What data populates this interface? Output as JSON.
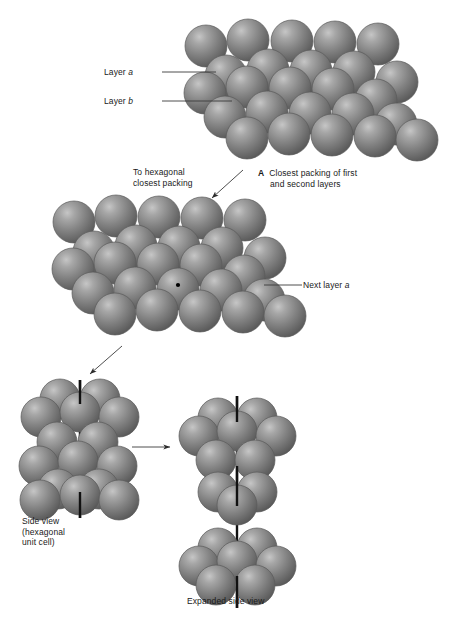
{
  "figure": {
    "title_panel_a": "A  Closest packing of first and second layers",
    "background_color": "#ffffff",
    "sphere_color": "#7d7d7d",
    "sphere_highlight_color": "#b9b9b9",
    "sphere_shadow_color": "#4a4a4a",
    "sphere_outline_color": "#5a5a5a",
    "line_color": "#3a3a3a",
    "axis_color": "#111111"
  },
  "labels": {
    "layer_a": {
      "text_prefix": "Layer ",
      "text_italic": "a"
    },
    "layer_b": {
      "text_prefix": "Layer ",
      "text_italic": "b"
    },
    "next_layer_a": {
      "text_prefix": "Next layer ",
      "text_italic": "a"
    },
    "to_hexagonal": {
      "line1": "To hexagonal",
      "line2": "closest packing"
    },
    "caption_a": {
      "marker": "A",
      "line1": "Closest packing of first",
      "line2": "and second layers"
    },
    "side_view": {
      "line1": "Side view",
      "line2": "(hexagonal",
      "line3": "unit cell)"
    },
    "expanded_side_view": {
      "text": "Expanded side view"
    }
  },
  "clusters": {
    "top": {
      "name": "closest-packing-first-second-layers",
      "radius": 21,
      "layers": [
        {
          "id": "a-back",
          "spheres": [
            [
              206,
              46
            ],
            [
              248,
              40
            ],
            [
              292,
              41
            ],
            [
              335,
              42
            ],
            [
              378,
              44
            ]
          ]
        },
        {
          "id": "b-mid",
          "spheres": [
            [
              226,
              76
            ],
            [
              268,
              70
            ],
            [
              311,
              71
            ],
            [
              354,
              72
            ],
            [
              397,
              82
            ]
          ]
        },
        {
          "id": "a-front",
          "spheres": [
            [
              205,
              93
            ],
            [
              247,
              87
            ],
            [
              290,
              88
            ],
            [
              333,
              89
            ],
            [
              376,
              100
            ]
          ]
        },
        {
          "id": "b-front",
          "spheres": [
            [
              225,
              117
            ],
            [
              267,
              112
            ],
            [
              310,
              113
            ],
            [
              353,
              114
            ],
            [
              396,
              124
            ]
          ]
        },
        {
          "id": "front",
          "spheres": [
            [
              247,
              138
            ],
            [
              289,
              134
            ],
            [
              332,
              135
            ],
            [
              375,
              136
            ],
            [
              417,
              140
            ]
          ]
        }
      ]
    },
    "middle": {
      "name": "next-layer-a-added",
      "radius": 21,
      "dot": [
        178,
        285
      ],
      "layers": [
        {
          "id": "row1",
          "spheres": [
            [
              74,
              222
            ],
            [
              116,
              216
            ],
            [
              159,
              217
            ],
            [
              202,
              218
            ],
            [
              245,
              220
            ]
          ]
        },
        {
          "id": "row2",
          "spheres": [
            [
              94,
              252
            ],
            [
              136,
              246
            ],
            [
              179,
              247
            ],
            [
              222,
              248
            ],
            [
              265,
              258
            ]
          ]
        },
        {
          "id": "row3",
          "spheres": [
            [
              73,
              269
            ],
            [
              115,
              263
            ],
            [
              158,
              264
            ],
            [
              201,
              265
            ],
            [
              244,
              276
            ]
          ]
        },
        {
          "id": "row4",
          "spheres": [
            [
              93,
              293
            ],
            [
              135,
              288
            ],
            [
              178,
              289
            ],
            [
              221,
              290
            ],
            [
              264,
              300
            ]
          ]
        },
        {
          "id": "row5",
          "spheres": [
            [
              115,
              314
            ],
            [
              157,
              310
            ],
            [
              200,
              311
            ],
            [
              243,
              312
            ],
            [
              285,
              316
            ]
          ]
        }
      ]
    },
    "side_view": {
      "name": "hexagonal-unit-cell-side-view",
      "radius": 20,
      "axis": {
        "x": 80,
        "y1": 380,
        "y2": 518
      },
      "spheres": [
        [
          60,
          399
        ],
        [
          100,
          399
        ],
        [
          41,
          417
        ],
        [
          80,
          412
        ],
        [
          119,
          417
        ],
        [
          57,
          442
        ],
        [
          98,
          442
        ],
        [
          39,
          466
        ],
        [
          78,
          461
        ],
        [
          117,
          466
        ],
        [
          58,
          489
        ],
        [
          99,
          489
        ],
        [
          40,
          500
        ],
        [
          80,
          495
        ],
        [
          119,
          500
        ]
      ]
    },
    "expanded_side_view": {
      "name": "expanded-side-view",
      "radius": 20,
      "axis": {
        "x": 237,
        "y1": 396,
        "y2": 608
      },
      "groups": [
        {
          "id": "layer-a-top",
          "spheres": [
            [
              218,
              418
            ],
            [
              257,
              418
            ],
            [
              199,
              436
            ],
            [
              237,
              431
            ],
            [
              276,
              436
            ],
            [
              216,
              460
            ],
            [
              255,
              460
            ]
          ]
        },
        {
          "id": "layer-b-mid",
          "spheres": [
            [
              218,
              492
            ],
            [
              257,
              492
            ],
            [
              237,
              505
            ]
          ]
        },
        {
          "id": "layer-a-bottom",
          "spheres": [
            [
              218,
              548
            ],
            [
              257,
              548
            ],
            [
              199,
              566
            ],
            [
              237,
              561
            ],
            [
              276,
              566
            ],
            [
              216,
              585
            ],
            [
              255,
              585
            ]
          ]
        }
      ]
    }
  },
  "connectors": {
    "leader_layer_a": {
      "x1": 162,
      "y1": 72,
      "x2": 216,
      "y2": 72
    },
    "leader_layer_b": {
      "x1": 162,
      "y1": 101,
      "x2": 232,
      "y2": 101
    },
    "leader_next_layer_a": {
      "x1": 264,
      "y1": 285,
      "x2": 302,
      "y2": 285
    },
    "arrow_to_hexagonal": {
      "x1": 243,
      "y1": 170,
      "x2": 212,
      "y2": 198
    },
    "arrow_to_side_view": {
      "x1": 122,
      "y1": 346,
      "x2": 90,
      "y2": 374
    },
    "arrow_expand": {
      "x1": 132,
      "y1": 447,
      "x2": 170,
      "y2": 447
    }
  }
}
